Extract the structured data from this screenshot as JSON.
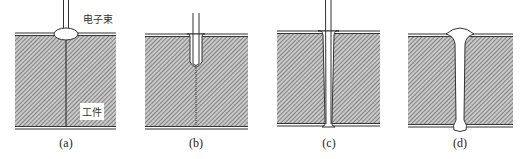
{
  "figure": {
    "colors": {
      "hatch": "#6a6a6a",
      "outline": "#333333",
      "background": "#ffffff"
    },
    "annotations": {
      "beam_label": "电子束",
      "workpiece_label": "工件"
    },
    "panels": [
      {
        "id": "a",
        "label": "(a)",
        "stage": "surface melting"
      },
      {
        "id": "b",
        "label": "(b)",
        "stage": "shallow keyhole"
      },
      {
        "id": "c",
        "label": "(c)",
        "stage": "full penetration keyhole"
      },
      {
        "id": "d",
        "label": "(d)",
        "stage": "weld bead formed"
      }
    ]
  }
}
